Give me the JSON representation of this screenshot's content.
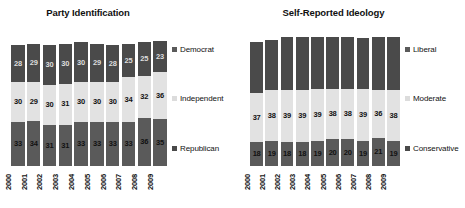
{
  "chart_data": [
    {
      "type": "bar",
      "title": "Party Identification",
      "xlabel": "",
      "ylabel": "",
      "stacked": true,
      "orientation": "vertical",
      "grid": false,
      "legend_position": "right",
      "ylim": [
        0,
        100
      ],
      "units": "percent",
      "categories": [
        "2000",
        "2001",
        "2002",
        "2003",
        "2004",
        "2005",
        "2006",
        "2007",
        "2008",
        "2009"
      ],
      "series": [
        {
          "name": "Democrat",
          "color": "#5a5a5a",
          "values": [
            33,
            34,
            31,
            31,
            33,
            33,
            33,
            33,
            36,
            35
          ]
        },
        {
          "name": "Independent",
          "color": "#e2e2e2",
          "values": [
            30,
            29,
            30,
            31,
            30,
            30,
            30,
            34,
            32,
            36
          ]
        },
        {
          "name": "Republican",
          "color": "#4a4a4a",
          "values": [
            28,
            29,
            30,
            30,
            30,
            29,
            28,
            25,
            25,
            23
          ]
        }
      ]
    },
    {
      "type": "bar",
      "title": "Self-Reported Ideology",
      "xlabel": "",
      "ylabel": "",
      "stacked": true,
      "orientation": "vertical",
      "grid": false,
      "legend_position": "right",
      "ylim": [
        0,
        100
      ],
      "units": "percent",
      "categories": [
        "2000",
        "2001",
        "2002",
        "2003",
        "2004",
        "2005",
        "2006",
        "2007",
        "2008",
        "2009"
      ],
      "series": [
        {
          "name": "Liberal",
          "color": "#5a5a5a",
          "values": [
            18,
            19,
            18,
            18,
            19,
            20,
            20,
            19,
            21,
            19
          ]
        },
        {
          "name": "Moderate",
          "color": "#e2e2e2",
          "values": [
            37,
            38,
            39,
            39,
            39,
            38,
            38,
            39,
            36,
            38
          ]
        },
        {
          "name": "Conservative",
          "color": "#4a4a4a",
          "values": [
            38,
            38,
            40,
            40,
            39,
            39,
            39,
            38,
            40,
            40
          ],
          "labels_shown": false
        }
      ]
    }
  ],
  "panels": [
    {
      "title": "Party Identification",
      "legend": [
        {
          "label": "Democrat",
          "swatch": "dark"
        },
        {
          "label": "Independent",
          "swatch": "light"
        },
        {
          "label": "Republican",
          "swatch": "darkest"
        }
      ]
    },
    {
      "title": "Self-Reported Ideology",
      "legend": [
        {
          "label": "Liberal",
          "swatch": "dark"
        },
        {
          "label": "Moderate",
          "swatch": "light"
        },
        {
          "label": "Conservative",
          "swatch": "darkest"
        }
      ]
    }
  ]
}
